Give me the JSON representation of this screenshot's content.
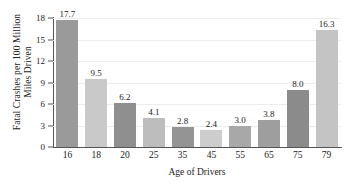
{
  "chart_data": {
    "type": "bar",
    "title": "",
    "subtitle": "",
    "xlabel": "Age of Drivers",
    "ylabel": "Fatal Crashes per 100 Million Miles Driven",
    "ylabel_line1": "Fatal Crashes per 100 Million",
    "ylabel_line2": "Miles Driven",
    "categories": [
      "16",
      "18",
      "20",
      "25",
      "35",
      "45",
      "55",
      "65",
      "75",
      "79"
    ],
    "values": [
      17.7,
      9.5,
      6.2,
      4.1,
      2.8,
      2.4,
      3.0,
      3.8,
      8.0,
      16.3
    ],
    "value_labels": [
      "17.7",
      "9.5",
      "6.2",
      "4.1",
      "2.8",
      "2.4",
      "3.0",
      "3.8",
      "8.0",
      "16.3"
    ],
    "ylim": [
      0,
      18
    ],
    "yticks": [
      0,
      3,
      6,
      9,
      12,
      15,
      18
    ],
    "ytick_labels": [
      "0",
      "3",
      "6",
      "9",
      "12",
      "15",
      "18"
    ],
    "grid": true,
    "grid_axis": "y",
    "legend": false,
    "legend_position": "none",
    "bar_colors": [
      "#9a9a9a",
      "#c9c9c9",
      "#8f8f8f",
      "#bdbdbd",
      "#949494",
      "#cdcdcd",
      "#a8a8a8",
      "#9e9e9e",
      "#8b8b8b",
      "#c4c4c4"
    ],
    "colors": {
      "background": "#ffffff",
      "axis": "#555555",
      "grid": "#ececec",
      "text": "#222222",
      "bar_dark": "#9a9a9a",
      "bar_light": "#c9c9c9"
    }
  }
}
